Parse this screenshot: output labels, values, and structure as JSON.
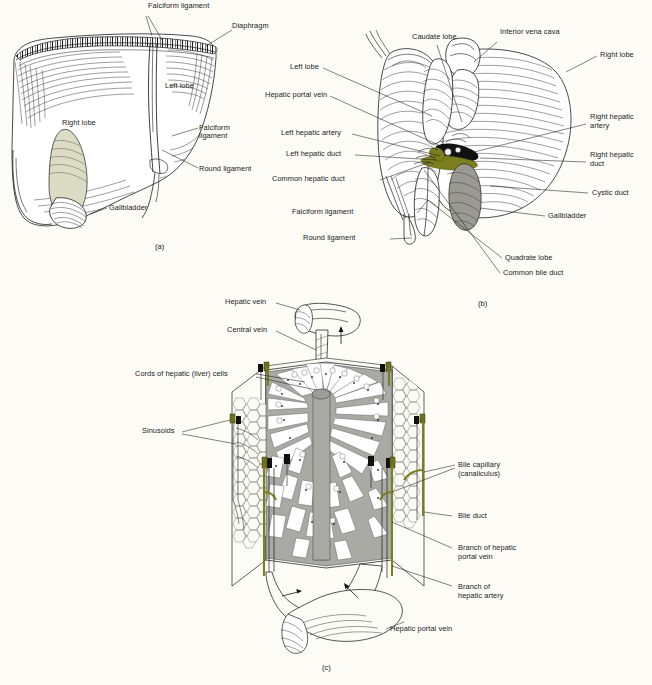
{
  "figure": {
    "background_color": "#fdfcf7",
    "ink_color": "#1c1c1c",
    "bile_color": "#7d7f1e",
    "gallbladder_a_color": "#dcdcc4",
    "gallbladder_b_color": "#9a9a93",
    "cord_color": "#a9aaa4"
  },
  "panels": [
    {
      "id": "a",
      "caption": "(a)",
      "name": "anterior-view-of-liver",
      "labels": [
        {
          "key": "falciform_ligament_top",
          "text": "Falciform ligament"
        },
        {
          "key": "diaphragm",
          "text": "Diaphragm"
        },
        {
          "key": "left_lobe",
          "text": "Left lobe"
        },
        {
          "key": "right_lobe",
          "text": "Right lobe"
        },
        {
          "key": "falciform_ligament_line1",
          "text": "Falciform"
        },
        {
          "key": "falciform_ligament_line2",
          "text": "ligament"
        },
        {
          "key": "round_ligament",
          "text": "Round ligament"
        },
        {
          "key": "gallbladder",
          "text": "Gallbladder"
        }
      ]
    },
    {
      "id": "b",
      "caption": "(b)",
      "name": "inferior-visceral-view-of-liver",
      "labels": [
        {
          "key": "caudate_lobe",
          "text": "Caudate lobe"
        },
        {
          "key": "inferior_vena_cava",
          "text": "Inferior vena cava"
        },
        {
          "key": "right_lobe",
          "text": "Right lobe"
        },
        {
          "key": "left_lobe",
          "text": "Left lobe"
        },
        {
          "key": "hepatic_portal_vein",
          "text": "Hepatic portal vein"
        },
        {
          "key": "left_hepatic_artery",
          "text": "Left hepatic artery"
        },
        {
          "key": "left_hepatic_duct",
          "text": "Left hepatic duct"
        },
        {
          "key": "common_hepatic_duct",
          "text": "Common hepatic duct"
        },
        {
          "key": "falciform_ligament",
          "text": "Falciform ligament"
        },
        {
          "key": "round_ligament",
          "text": "Round ligament"
        },
        {
          "key": "right_hepatic_artery_line1",
          "text": "Right hepatic"
        },
        {
          "key": "right_hepatic_artery_line2",
          "text": "artery"
        },
        {
          "key": "right_hepatic_duct_line1",
          "text": "Right hepatic"
        },
        {
          "key": "right_hepatic_duct_line2",
          "text": "duct"
        },
        {
          "key": "cystic_duct",
          "text": "Cystic duct"
        },
        {
          "key": "gallbladder",
          "text": "Gallbladder"
        },
        {
          "key": "quadrate_lobe",
          "text": "Quadrate lobe"
        },
        {
          "key": "common_bile_duct",
          "text": "Common bile duct"
        }
      ]
    },
    {
      "id": "c",
      "caption": "(c)",
      "name": "hepatic-lobule",
      "labels": [
        {
          "key": "hepatic_vein",
          "text": "Hepatic vein"
        },
        {
          "key": "central_vein",
          "text": "Central vein"
        },
        {
          "key": "cords_of_hepatic_cells",
          "text": "Cords of hepatic (liver) cells"
        },
        {
          "key": "sinusoids",
          "text": "Sinusoids"
        },
        {
          "key": "bile_capillary_line1",
          "text": "Bile capillary"
        },
        {
          "key": "bile_capillary_line2",
          "text": "(canaliculus)"
        },
        {
          "key": "bile_duct",
          "text": "Bile duct"
        },
        {
          "key": "branch_hepatic_portal_line1",
          "text": "Branch of hepatic"
        },
        {
          "key": "branch_hepatic_portal_line2",
          "text": "portal vein"
        },
        {
          "key": "branch_hepatic_artery_line1",
          "text": "Branch of"
        },
        {
          "key": "branch_hepatic_artery_line2",
          "text": "hepatic artery"
        },
        {
          "key": "hepatic_portal_vein",
          "text": "Hepatic portal vein"
        }
      ]
    }
  ],
  "labels_a": {
    "falciform_ligament_top": "Falciform ligament",
    "diaphragm": "Diaphragm",
    "left_lobe": "Left lobe",
    "right_lobe": "Right lobe",
    "falciform_l1": "Falciform",
    "falciform_l2": "ligament",
    "round_ligament": "Round ligament",
    "gallbladder": "Gallbladder",
    "caption": "(a)"
  },
  "labels_b": {
    "caudate_lobe": "Caudate lobe",
    "inferior_vena_cava": "Inferior vena cava",
    "right_lobe": "Right lobe",
    "left_lobe": "Left lobe",
    "hepatic_portal_vein": "Hepatic portal vein",
    "left_hepatic_artery": "Left hepatic artery",
    "left_hepatic_duct": "Left hepatic duct",
    "common_hepatic_duct": "Common hepatic duct",
    "falciform_ligament": "Falciform ligament",
    "round_ligament": "Round ligament",
    "right_hepatic_artery_1": "Right hepatic",
    "right_hepatic_artery_2": "artery",
    "right_hepatic_duct_1": "Right hepatic",
    "right_hepatic_duct_2": "duct",
    "cystic_duct": "Cystic duct",
    "gallbladder": "Gallbladder",
    "quadrate_lobe": "Quadrate lobe",
    "common_bile_duct": "Common bile duct",
    "caption": "(b)"
  },
  "labels_c": {
    "hepatic_vein": "Hepatic vein",
    "central_vein": "Central vein",
    "cords": "Cords of hepatic (liver) cells",
    "sinusoids": "Sinusoids",
    "bile_capillary_1": "Bile capillary",
    "bile_capillary_2": "(canaliculus)",
    "bile_duct": "Bile duct",
    "branch_portal_1": "Branch of hepatic",
    "branch_portal_2": "portal vein",
    "branch_artery_1": "Branch of",
    "branch_artery_2": "hepatic artery",
    "hepatic_portal_vein": "Hepatic portal vein",
    "caption": "(c)"
  }
}
